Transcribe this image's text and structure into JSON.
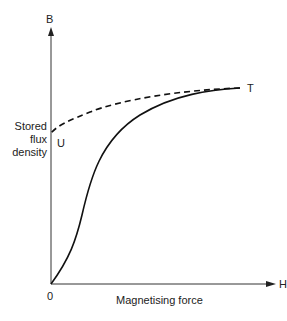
{
  "diagram": {
    "axes": {
      "y_label": "B",
      "x_label": "H",
      "origin_label": "0",
      "x_axis_title": "Magnetising force",
      "y_axis_title_lines": [
        "Stored",
        "flux",
        "density"
      ]
    },
    "points": {
      "T": "T",
      "U": "U"
    },
    "curves": [
      {
        "name": "magnetisation curve",
        "style": "solid",
        "from": "0",
        "to": "T"
      },
      {
        "name": "demagnetisation curve",
        "style": "dashed",
        "from": "T",
        "to": "U"
      }
    ]
  }
}
